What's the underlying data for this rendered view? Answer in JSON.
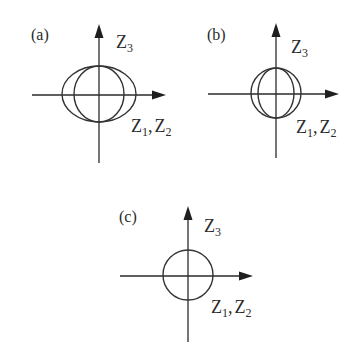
{
  "figure": {
    "background": "#ffffff",
    "ink_color": "#2a2a2a",
    "panels": [
      {
        "id": "a",
        "label": "(a)",
        "vertical_axis_label": {
          "base": "Z",
          "sub": "3"
        },
        "horizontal_axis_label": {
          "base1": "Z",
          "sub1": "1",
          "sep": ",",
          "base2": "Z",
          "sub2": "2"
        },
        "description": "Oblate ellipse (wider along Z1,Z2) overlaid with circle",
        "shapes": [
          {
            "type": "ellipse",
            "rx": 37,
            "ry": 28
          },
          {
            "type": "ellipse",
            "rx": 25,
            "ry": 28
          }
        ]
      },
      {
        "id": "b",
        "label": "(b)",
        "vertical_axis_label": {
          "base": "Z",
          "sub": "3"
        },
        "horizontal_axis_label": {
          "base1": "Z",
          "sub1": "1",
          "sep": ",",
          "base2": "Z",
          "sub2": "2"
        },
        "description": "Circle overlaid with prolate ellipse (taller along Z3)",
        "shapes": [
          {
            "type": "ellipse",
            "rx": 25,
            "ry": 25
          },
          {
            "type": "ellipse",
            "rx": 18,
            "ry": 25
          }
        ]
      },
      {
        "id": "c",
        "label": "(c)",
        "vertical_axis_label": {
          "base": "Z",
          "sub": "3"
        },
        "horizontal_axis_label": {
          "base1": "Z",
          "sub1": "1",
          "sep": ",",
          "base2": "Z",
          "sub2": "2"
        },
        "description": "Single circle (isotropic)",
        "shapes": [
          {
            "type": "circle",
            "r": 25
          }
        ]
      }
    ]
  }
}
